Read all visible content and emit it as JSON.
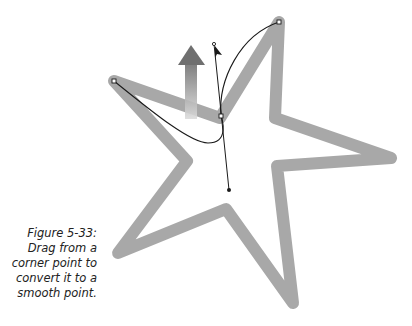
{
  "figure": {
    "caption": {
      "label": "Figure 5-33:",
      "lines": [
        "Drag from a",
        "corner point to",
        "convert it to a",
        "smooth point."
      ]
    },
    "colors": {
      "star_stroke": "#a8a8a8",
      "path_line": "#1a1a1a",
      "arrow_top": "#6f6f6f",
      "arrow_bottom": "#d8d8d8",
      "background": "#ffffff"
    },
    "elements": {
      "star": "five-point star outline (light gray, thick stroke)",
      "bezier_path": "black curve through anchor points",
      "anchor_points": 3,
      "direction_handle": "straight line with endpoints through center anchor",
      "cursor": "black arrow pointer",
      "drag_arrow": "gradient gray up arrow"
    }
  }
}
